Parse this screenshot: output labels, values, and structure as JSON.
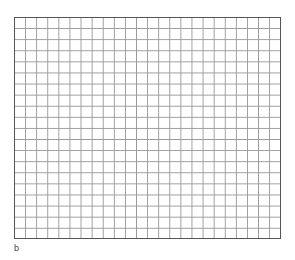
{
  "figure": {
    "grid": {
      "columns": 24,
      "rows": 20,
      "line_color": "#9a9a9a",
      "border_color": "#555555"
    },
    "label": "b"
  }
}
